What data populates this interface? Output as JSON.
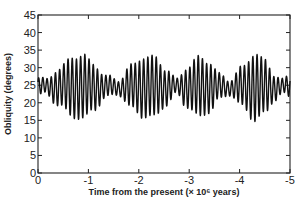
{
  "chart_data": {
    "type": "line",
    "title": "",
    "xlabel": "Time from the present (× 10⁶ years)",
    "ylabel": "Obliquity (degrees)",
    "xlim": [
      0,
      -5
    ],
    "ylim": [
      0,
      45
    ],
    "x_ticks": [
      0,
      -1,
      -2,
      -3,
      -4,
      -5
    ],
    "x_tick_labels": [
      "0",
      "-1",
      "-2",
      "-3",
      "-4",
      "-5"
    ],
    "y_ticks": [
      0,
      5,
      10,
      15,
      20,
      25,
      30,
      35,
      40,
      45
    ],
    "y_tick_labels": [
      "0",
      "5",
      "10",
      "15",
      "20",
      "25",
      "30",
      "35",
      "40",
      "45"
    ],
    "grid": false,
    "legend": null,
    "series": [
      {
        "name": "Obliquity",
        "color": "#111111",
        "mean": 24.5,
        "cycles_per_myr": 12,
        "envelope_points": [
          [
            0.0,
            2.5
          ],
          [
            -0.15,
            2.0
          ],
          [
            -0.4,
            5.0
          ],
          [
            -0.7,
            8.5
          ],
          [
            -0.9,
            9.0
          ],
          [
            -1.1,
            6.5
          ],
          [
            -1.35,
            3.0
          ],
          [
            -1.6,
            2.0
          ],
          [
            -1.85,
            6.0
          ],
          [
            -2.1,
            8.5
          ],
          [
            -2.3,
            8.5
          ],
          [
            -2.55,
            5.0
          ],
          [
            -2.75,
            2.0
          ],
          [
            -2.95,
            5.5
          ],
          [
            -3.2,
            8.5
          ],
          [
            -3.4,
            7.0
          ],
          [
            -3.6,
            3.5
          ],
          [
            -3.8,
            2.0
          ],
          [
            -4.05,
            5.5
          ],
          [
            -4.3,
            9.5
          ],
          [
            -4.5,
            7.5
          ],
          [
            -4.7,
            3.5
          ],
          [
            -4.85,
            2.0
          ],
          [
            -5.0,
            3.0
          ]
        ],
        "approx_peaks": [
          {
            "x": -0.85,
            "y": 34
          },
          {
            "x": -2.3,
            "y": 33
          },
          {
            "x": -3.25,
            "y": 33
          },
          {
            "x": -4.3,
            "y": 34
          }
        ],
        "approx_troughs": [
          {
            "x": -0.85,
            "y": 16
          },
          {
            "x": -2.2,
            "y": 15
          },
          {
            "x": -3.3,
            "y": 16
          },
          {
            "x": -4.35,
            "y": 16
          }
        ],
        "range_description": "oscillates roughly between 15 and 34 degrees around a mean of ~24.5"
      }
    ]
  }
}
